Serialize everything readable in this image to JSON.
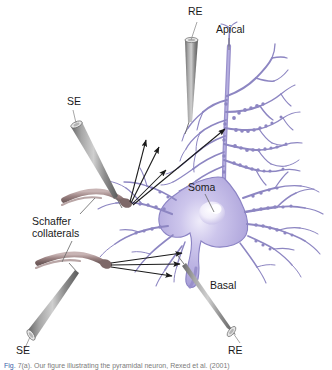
{
  "figure": {
    "background_color": "#ffffff",
    "colors": {
      "soma_fill": "#b3aade",
      "soma_highlight": "#efecfa",
      "dendrite": "#8d86c2",
      "dendrite_dark": "#6f6aa6",
      "axon_fiber": "#9c8383",
      "axon_fiber_dark": "#6f5b5b",
      "electrode_gray": "#8a8a8a",
      "electrode_dark": "#5d5d5d",
      "electrode_light": "#d8d8d8",
      "arrow": "#1a1a1a",
      "leader_line": "#6d6d6d",
      "label_text": "#1a1a1a"
    }
  },
  "labels": {
    "recording_top": "RE",
    "apical": "Apical",
    "stim_top": "SE",
    "schaffer_line1": "Schaffer",
    "schaffer_line2": "collaterals",
    "soma": "Soma",
    "basal": "Basal",
    "stim_bottom": "SE",
    "recording_bottom": "RE"
  },
  "elements": {
    "neuron": "pyramidal-neuron",
    "soma_shape": "pyramidal-soma",
    "apical_tree": "apical-dendritic-tree",
    "basal_tree": "basal-dendritic-tree",
    "axon": "axon",
    "spines": "dendritic-spines",
    "schaffer_upper": "schaffer-collateral-upper",
    "schaffer_lower": "schaffer-collateral-lower",
    "electrode_re_top": "recording-electrode-apical",
    "electrode_se_top": "stimulating-electrode-upper",
    "electrode_se_bottom": "stimulating-electrode-lower",
    "electrode_re_bottom": "recording-electrode-basal",
    "arrows_upper": "synaptic-projection-arrows-apical",
    "arrows_lower": "synaptic-projection-arrows-basal"
  },
  "caption": {
    "tag": "Fig.",
    "text": "7(a). Our figure illustrating the pyramidal neuron, Rexed et al. (2001)"
  }
}
